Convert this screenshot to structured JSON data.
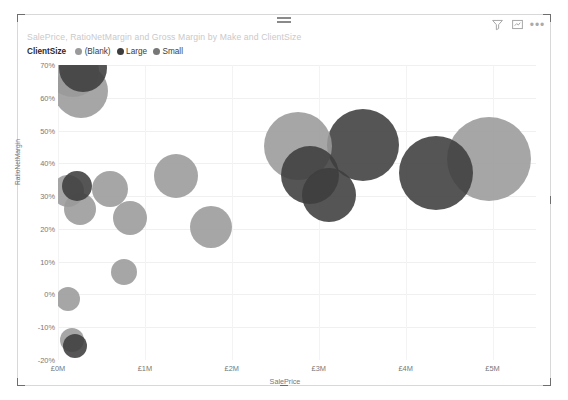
{
  "visual": {
    "title": "SalePrice, RatioNetMargin and Gross Margin by Make and ClientSize",
    "actions": {
      "filter": "filter-icon",
      "focus": "focus-mode-icon",
      "more": "•••"
    },
    "drag_handle": "drag-handle"
  },
  "legend": {
    "title": "ClientSize",
    "items": [
      {
        "label": "(Blank)",
        "color": "#9a9a9a"
      },
      {
        "label": "Large",
        "color": "#3d3d3d"
      },
      {
        "label": "Small",
        "color": "#777777"
      }
    ]
  },
  "chart_data": {
    "type": "scatter",
    "title": "SalePrice, RatioNetMargin and Gross Margin by Make and ClientSize",
    "xlabel": "SalePrice",
    "ylabel": "RatioNetMargin",
    "size_field": "Gross Margin",
    "grid": true,
    "legend_position": "top-left",
    "xlim": [
      0,
      5500000
    ],
    "ylim": [
      -0.2,
      0.7
    ],
    "xticks": [
      {
        "value": 0,
        "label": "£0M"
      },
      {
        "value": 1000000,
        "label": "£1M"
      },
      {
        "value": 2000000,
        "label": "£2M"
      },
      {
        "value": 3000000,
        "label": "£3M"
      },
      {
        "value": 4000000,
        "label": "£4M"
      },
      {
        "value": 5000000,
        "label": "£5M"
      }
    ],
    "yticks": [
      {
        "value": 0.7,
        "label": "70%"
      },
      {
        "value": 0.6,
        "label": "60%"
      },
      {
        "value": 0.5,
        "label": "50%"
      },
      {
        "value": 0.4,
        "label": "40%"
      },
      {
        "value": 0.3,
        "label": "30%"
      },
      {
        "value": 0.2,
        "label": "20%"
      },
      {
        "value": 0.1,
        "label": "10%"
      },
      {
        "value": 0.0,
        "label": "0%"
      },
      {
        "value": -0.1,
        "label": "-10%"
      },
      {
        "value": -0.2,
        "label": "-20%"
      }
    ],
    "series": [
      {
        "name": "(Blank)",
        "color": "#9a9a9a",
        "points": [
          {
            "x": 170000,
            "y": 0.683,
            "size": 26
          },
          {
            "x": 270000,
            "y": 0.62,
            "size": 27
          },
          {
            "x": 120000,
            "y": 0.317,
            "size": 16
          },
          {
            "x": 250000,
            "y": 0.262,
            "size": 16
          },
          {
            "x": 600000,
            "y": 0.322,
            "size": 18
          },
          {
            "x": 830000,
            "y": 0.232,
            "size": 17
          },
          {
            "x": 760000,
            "y": 0.068,
            "size": 13
          },
          {
            "x": 110000,
            "y": -0.015,
            "size": 12
          },
          {
            "x": 160000,
            "y": -0.14,
            "size": 12
          },
          {
            "x": 1360000,
            "y": 0.36,
            "size": 22
          },
          {
            "x": 1760000,
            "y": 0.205,
            "size": 21
          },
          {
            "x": 2760000,
            "y": 0.452,
            "size": 34
          },
          {
            "x": 4960000,
            "y": 0.412,
            "size": 42
          }
        ]
      },
      {
        "name": "Large",
        "color": "#3d3d3d",
        "points": [
          {
            "x": 290000,
            "y": 0.69,
            "size": 24
          },
          {
            "x": 220000,
            "y": 0.33,
            "size": 15
          },
          {
            "x": 195000,
            "y": -0.158,
            "size": 12
          },
          {
            "x": 2900000,
            "y": 0.365,
            "size": 29
          },
          {
            "x": 3120000,
            "y": 0.302,
            "size": 27
          },
          {
            "x": 3510000,
            "y": 0.455,
            "size": 36
          },
          {
            "x": 4350000,
            "y": 0.37,
            "size": 37
          }
        ]
      }
    ]
  }
}
